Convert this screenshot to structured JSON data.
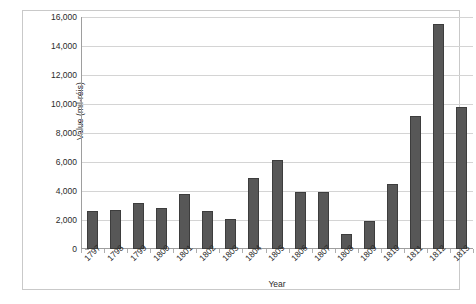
{
  "chart_data": {
    "type": "bar",
    "title": "",
    "xlabel": "Year",
    "ylabel": "Value (mil-réis)",
    "categories": [
      "1797",
      "1798",
      "1799",
      "1800",
      "1801",
      "1802",
      "1803",
      "1804",
      "1805",
      "1806",
      "1807",
      "1808",
      "1809",
      "1810",
      "1811",
      "1812",
      "1813"
    ],
    "values": [
      2650,
      2700,
      3150,
      2800,
      3800,
      2650,
      2100,
      4900,
      6150,
      3950,
      3950,
      1050,
      1950,
      4500,
      9150,
      15500,
      9800
    ],
    "ylim": [
      0,
      16000
    ],
    "ytick_step": 2000,
    "ytick_labels": [
      "0",
      "2,000",
      "4,000",
      "6,000",
      "8,000",
      "10,000",
      "12,000",
      "14,000",
      "16,000"
    ],
    "ytick_values": [
      0,
      2000,
      4000,
      6000,
      8000,
      10000,
      12000,
      14000,
      16000
    ],
    "grid": true,
    "legend": false,
    "legend_position": "none",
    "bar_color": "#575757",
    "gridline_color": "#d4d4d4",
    "axis_color": "#9e9e9e",
    "frame_color": "#c9c9c9",
    "background_color": "#ffffff",
    "xtick_label_rotation": -45
  }
}
